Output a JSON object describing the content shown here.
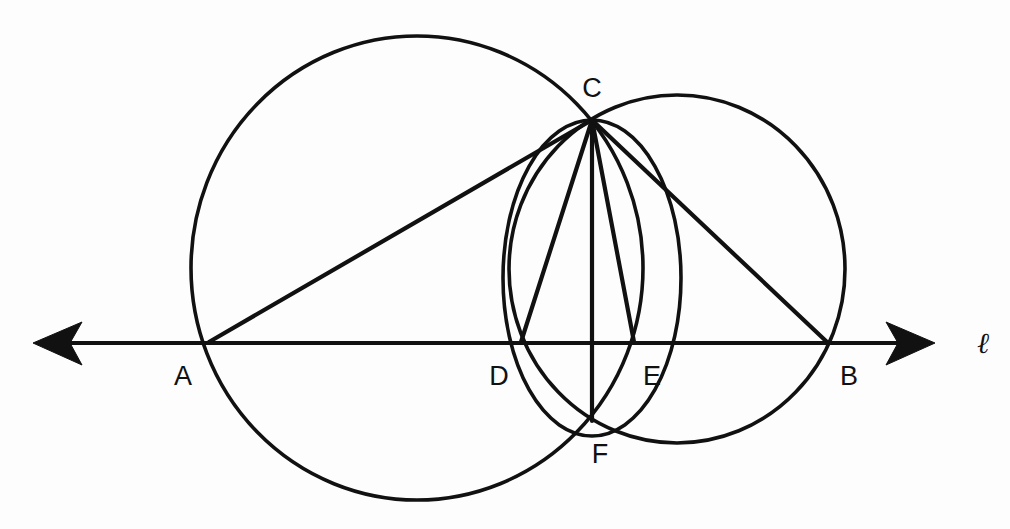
{
  "figure": {
    "background_color": "#fdfdfd",
    "stroke_color": "#111111"
  },
  "line": {
    "name": "l",
    "label": "ℓ",
    "label_x": 983,
    "label_y": 353,
    "y": 343,
    "x_start": 33,
    "x_end": 935,
    "left_arrow": "arrow-left",
    "right_arrow": "arrow-right"
  },
  "points": [
    {
      "id": "A",
      "label": "A",
      "x": 209,
      "y": 342,
      "label_x": 183,
      "label_y": 385
    },
    {
      "id": "B",
      "label": "B",
      "x": 827,
      "y": 342,
      "label_x": 849,
      "label_y": 385
    },
    {
      "id": "C",
      "label": "C",
      "x": 592,
      "y": 120,
      "label_x": 592,
      "label_y": 97
    },
    {
      "id": "D",
      "label": "D",
      "x": 521,
      "y": 342,
      "label_x": 499,
      "label_y": 385
    },
    {
      "id": "E",
      "label": "E",
      "x": 634,
      "y": 342,
      "label_x": 652,
      "label_y": 385
    },
    {
      "id": "F",
      "label": "F",
      "x": 592,
      "y": 421,
      "label_x": 600,
      "label_y": 463
    }
  ],
  "circles": [
    {
      "id": "big-circle",
      "name": "circle-through-A-C-B",
      "cx": 417,
      "cy": 268,
      "rx": 226,
      "ry": 232
    },
    {
      "id": "right-circle",
      "name": "circle-through-C-E-B",
      "cx": 677,
      "cy": 269,
      "rx": 168,
      "ry": 174
    },
    {
      "id": "small-circle",
      "name": "circle-through-C-D-E-F",
      "cx": 592,
      "cy": 278,
      "rx": 89,
      "ry": 158
    }
  ],
  "segments": [
    {
      "id": "AC",
      "name": "segment-A-C",
      "x1": 209,
      "y1": 342,
      "x2": 592,
      "y2": 120
    },
    {
      "id": "CD",
      "name": "segment-C-D",
      "x1": 592,
      "y1": 120,
      "x2": 521,
      "y2": 342
    },
    {
      "id": "CF",
      "name": "segment-C-F",
      "x1": 592,
      "y1": 120,
      "x2": 592,
      "y2": 421
    },
    {
      "id": "CE",
      "name": "segment-C-E",
      "x1": 592,
      "y1": 120,
      "x2": 634,
      "y2": 342
    },
    {
      "id": "CB",
      "name": "segment-C-B",
      "x1": 592,
      "y1": 120,
      "x2": 827,
      "y2": 342
    }
  ]
}
